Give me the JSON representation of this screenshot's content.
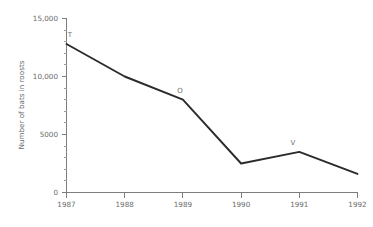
{
  "chart_data": {
    "type": "line",
    "title": "",
    "xlabel": "",
    "ylabel": "Number of bats in roosts",
    "x": [
      1987,
      1988,
      1989,
      1990,
      1991,
      1992
    ],
    "categories": [
      "1987",
      "1988",
      "1989",
      "1990",
      "1991",
      "1992"
    ],
    "values": [
      12800,
      10000,
      8000,
      2500,
      3500,
      1600
    ],
    "series": [
      {
        "name": "Number of bats in roosts",
        "values": [
          12800,
          10000,
          8000,
          2500,
          3500,
          1600
        ]
      }
    ],
    "xlim": [
      1987,
      1992
    ],
    "ylim": [
      0,
      15000
    ],
    "grid": false,
    "legend": false,
    "y_ticks": [
      0,
      5000,
      10000,
      15000
    ],
    "y_tick_labels": [
      "0",
      "5000",
      "10,000",
      "15,000"
    ],
    "y_minor_tick_step": 1000,
    "x_ticks": [
      1987,
      1988,
      1989,
      1990,
      1991,
      1992
    ],
    "x_tick_labels": [
      "1987",
      "1988",
      "1989",
      "1990",
      "1991",
      "1992"
    ],
    "annotations": [
      {
        "label": "T",
        "x": 1987,
        "y": 12800
      },
      {
        "label": "O",
        "x": 1989,
        "y": 8000
      },
      {
        "label": "V",
        "x": 1991,
        "y": 3500
      }
    ],
    "colors": {
      "line": "#2b2b2b",
      "axis": "#7d7d7d",
      "text": "#6a6a6a",
      "annotation": "#6f6f6f",
      "background": "#ffffff"
    }
  },
  "axis": {
    "y_title": "Number of bats in roosts",
    "y_labels": {
      "t0": "0",
      "t5000": "5000",
      "t10000": "10,000",
      "t15000": "15,000"
    },
    "x_labels": {
      "y1987": "1987",
      "y1988": "1988",
      "y1989": "1989",
      "y1990": "1990",
      "y1991": "1991",
      "y1992": "1992"
    }
  },
  "annotations": {
    "a1": "T",
    "a2": "O",
    "a3": "V"
  }
}
